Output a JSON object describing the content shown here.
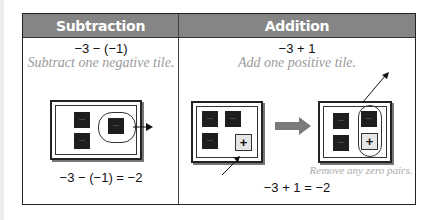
{
  "columns": [
    {
      "header": "Subtraction",
      "expression": "−3 − (−1)",
      "instruction": "Subtract one negative tile.",
      "mat": {
        "negative_tiles": 3,
        "positive_tiles": 0,
        "circled": "1 negative tile removed (arrow out)"
      },
      "result": "−3 − (−1) = −2"
    },
    {
      "header": "Addition",
      "expression": "−3 + 1",
      "instruction": "Add one positive tile.",
      "mat_before": {
        "negative_tiles": 3,
        "positive_tiles": 1
      },
      "mat_after": {
        "negative_tiles": 3,
        "positive_tiles": 1,
        "circled": "zero pair removed"
      },
      "tile_positive_label": "+",
      "note": "Remove any zero pairs.",
      "result": "−3 + 1 = −2"
    }
  ],
  "colors": {
    "header_bg": "#858585",
    "header_text": "#ffffff",
    "tile_negative": "#1e1e1e",
    "tile_positive": "#e6e6e6",
    "note_text": "#9a9a9a",
    "arrow_gray": "#7a7a7a"
  }
}
